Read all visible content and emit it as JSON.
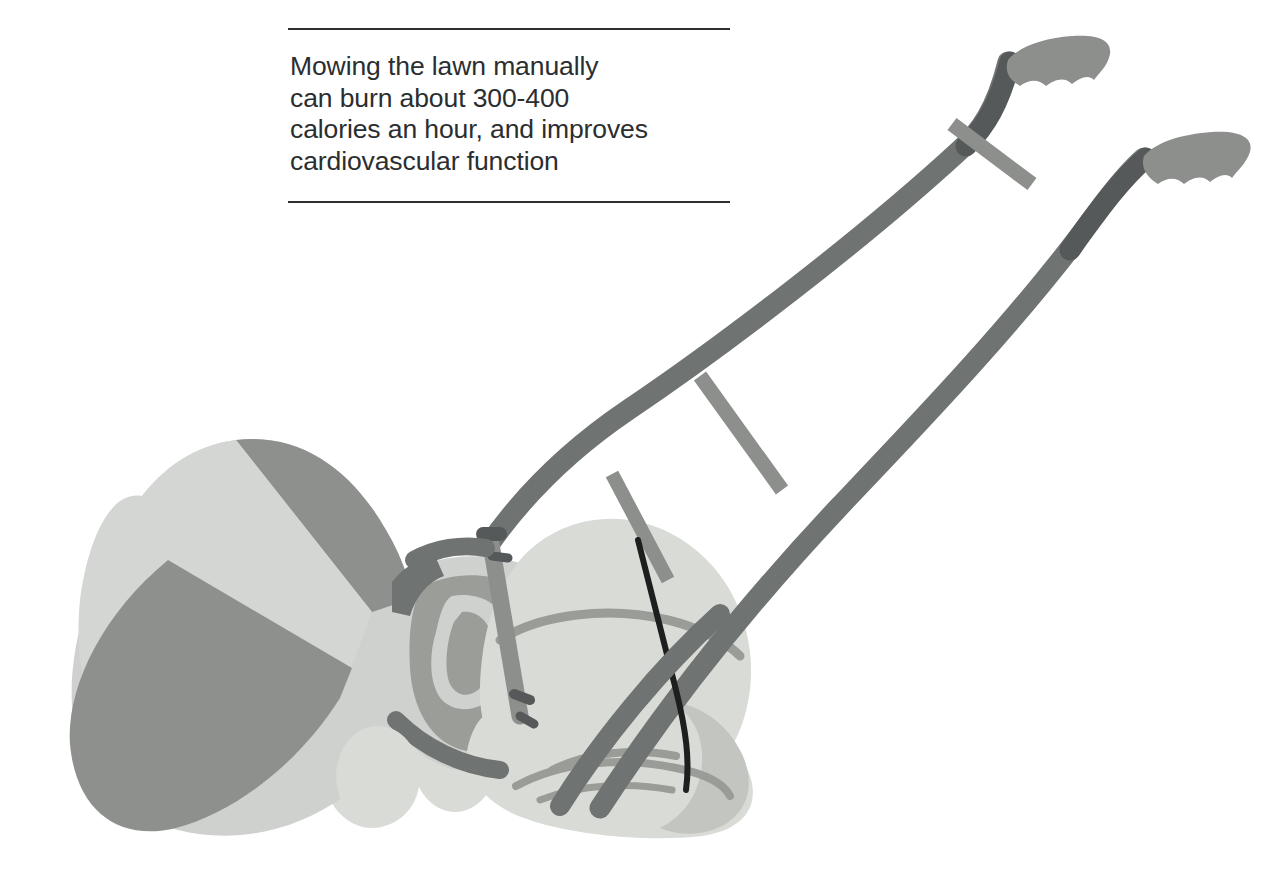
{
  "page": {
    "background_color": "#ffffff",
    "width": 1274,
    "height": 881
  },
  "caption": {
    "text": "Mowing the lawn manually\ncan burn about 300-400\ncalories an hour, and improves\ncardiovascular function",
    "lines": [
      "Mowing the lawn manually",
      "can burn about 300-400",
      "calories an hour, and improves",
      "cardiovascular function"
    ],
    "text_color": "#2b2e30",
    "rule_color": "#2c2f31"
  },
  "illustration": {
    "subject": "push reel lawn mower with grass catcher",
    "palette": {
      "light_gray": "#d2d4d1",
      "pale_gray": "#dcdeda",
      "mid_gray": "#8d8f8c",
      "medium_gray": "#9b9d99",
      "bar_gray": "#6f7371",
      "dark_gray": "#55595a",
      "shadow_gray": "#7d807d",
      "blade_black": "#1d1f1f",
      "line_gray": "#9a9c98"
    },
    "parts": [
      {
        "name": "grass-catcher",
        "label": "grass catcher funnel"
      },
      {
        "name": "mower-body",
        "label": "mower body housing"
      },
      {
        "name": "reel-roller",
        "label": "cutting reel roller"
      },
      {
        "name": "left-handle-bar",
        "label": "left handle bar"
      },
      {
        "name": "right-handle-bar",
        "label": "right handle bar"
      },
      {
        "name": "handle-grip-upper",
        "label": "upper handle grip"
      },
      {
        "name": "handle-grip-lower",
        "label": "lower handle grip"
      },
      {
        "name": "cross-brace-upper",
        "label": "upper cross brace"
      },
      {
        "name": "cross-brace-lower",
        "label": "lower cross brace"
      },
      {
        "name": "vertical-strut",
        "label": "vertical support strut"
      },
      {
        "name": "blade-edge",
        "label": "blade edge line"
      },
      {
        "name": "wheel",
        "label": "mower wheel"
      }
    ]
  }
}
